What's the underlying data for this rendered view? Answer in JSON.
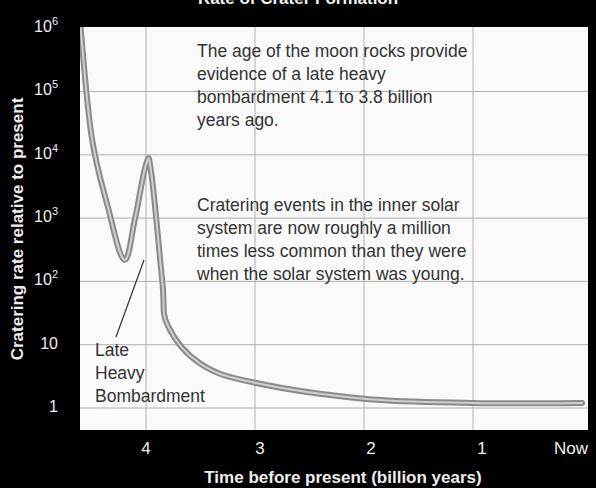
{
  "chart_data": {
    "type": "line",
    "title": "Rate of Crater Formation",
    "xlabel": "Time before present (billion years)",
    "ylabel": "Cratering rate relative to present",
    "yscale": "log",
    "ylim": [
      1,
      1000000
    ],
    "xlim": [
      4.6,
      0
    ],
    "grid": true,
    "x_ticks": [
      "4",
      "3",
      "2",
      "1",
      "Now"
    ],
    "y_ticks": [
      {
        "base": "10",
        "exp": "6"
      },
      {
        "base": "10",
        "exp": "5"
      },
      {
        "base": "10",
        "exp": "4"
      },
      {
        "base": "10",
        "exp": "3"
      },
      {
        "base": "10",
        "exp": "2"
      },
      {
        "base": "10",
        "exp": ""
      },
      {
        "base": "1",
        "exp": ""
      }
    ],
    "series": [
      {
        "name": "Cratering rate",
        "x": [
          4.6,
          4.5,
          4.35,
          4.2,
          4.1,
          4.0,
          3.95,
          3.85,
          3.8,
          3.5,
          3.0,
          2.0,
          1.0,
          0.0
        ],
        "values": [
          1000000,
          20000,
          1500,
          220,
          1000,
          7000,
          5000,
          100,
          20,
          5,
          2.5,
          1.4,
          1.2,
          1.2
        ]
      }
    ],
    "annotations": [
      {
        "id": "lhb",
        "text_lines": [
          "Late",
          "Heavy",
          "Bombardment"
        ],
        "points_to": {
          "x": 4.0,
          "y": 220
        }
      },
      {
        "id": "note1",
        "text_lines": [
          "The age of the moon rocks provide",
          "evidence of a late heavy",
          "bombardment 4.1 to 3.8 billion",
          "years ago."
        ]
      },
      {
        "id": "note2",
        "text_lines": [
          "Cratering events in the inner solar",
          "system are now roughly a million",
          "times less common than they were",
          "when the solar system was young."
        ]
      }
    ],
    "colors": {
      "background": "#000000",
      "plot_bg": "#fafafa",
      "grid": "#b0b0b0",
      "curve": "#888888",
      "curve_highlight": "#d0d0d0"
    }
  }
}
